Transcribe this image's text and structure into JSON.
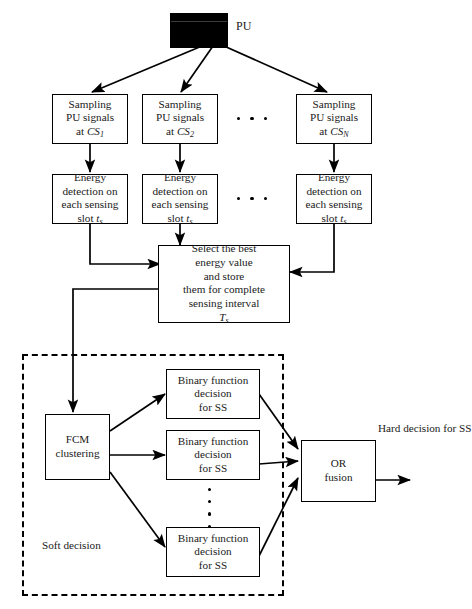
{
  "diagram": {
    "title_label": "PU",
    "source": {
      "name": "primary-user",
      "label": "PU"
    },
    "sampling_boxes": [
      {
        "line1": "Sampling",
        "line2": "PU signals",
        "line3_prefix": "at ",
        "line3_sym": "CS",
        "line3_sub": "1"
      },
      {
        "line1": "Sampling",
        "line2": "PU signals",
        "line3_prefix": "at ",
        "line3_sym": "CS",
        "line3_sub": "2"
      },
      {
        "line1": "Sampling",
        "line2": "PU signals",
        "line3_prefix": "at ",
        "line3_sym": "CS",
        "line3_sub": "N"
      }
    ],
    "energy_boxes": [
      {
        "line1": "Energy",
        "line2": "detection on",
        "line3": "each sensing",
        "line4_prefix": "slot ",
        "line4_sym": "t",
        "line4_sub": "s"
      },
      {
        "line1": "Energy",
        "line2": "detection on",
        "line3": "each sensing",
        "line4_prefix": "slot ",
        "line4_sym": "t",
        "line4_sub": "s"
      },
      {
        "line1": "Energy",
        "line2": "detection on",
        "line3": "each sensing",
        "line4_prefix": "slot ",
        "line4_sym": "t",
        "line4_sub": "s"
      }
    ],
    "select_box": {
      "line1": "Select the best",
      "line2": "energy value",
      "line3": "and store",
      "line4": "them for complete",
      "line5": "sensing interval",
      "line6_sym": "T",
      "line6_sub": "s"
    },
    "fcm_box": {
      "line1": "FCM",
      "line2": "clustering"
    },
    "binary_boxes": [
      {
        "line1": "Binary function",
        "line2": "decision",
        "line3": "for SS"
      },
      {
        "line1": "Binary function",
        "line2": "decision",
        "line3": "for SS"
      },
      {
        "line1": "Binary function",
        "line2": "decision",
        "line3": "for SS"
      }
    ],
    "fusion_box": {
      "line1": "OR",
      "line2": "fusion"
    },
    "output_label": {
      "line1": "Hard decision",
      "line2": "for  SS"
    },
    "region_label": {
      "line1": "Soft",
      "line2": "decision"
    },
    "ellipsis": {
      "horizontal_count": 3,
      "vertical_count": 4
    },
    "colors": {
      "stroke": "#000000",
      "fill": "#ffffff",
      "block": "#000000"
    }
  }
}
